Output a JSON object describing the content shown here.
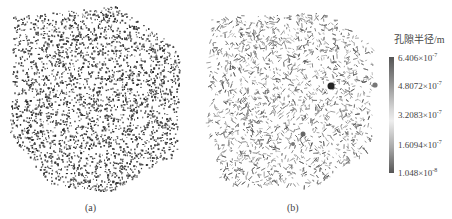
{
  "figure": {
    "panels": [
      {
        "id": "a",
        "caption": "(a)",
        "description": "3D point cloud of pore structure (dense, dark)"
      },
      {
        "id": "b",
        "caption": "(b)",
        "description": "3D pore network model colored by pore radius"
      }
    ],
    "colorbar": {
      "title": "孔隙半径/m",
      "ticks": [
        {
          "mantissa": "6.406",
          "exponent": "-7"
        },
        {
          "mantissa": "4.8072",
          "exponent": "-7"
        },
        {
          "mantissa": "3.2083",
          "exponent": "-7"
        },
        {
          "mantissa": "1.6094",
          "exponent": "-7"
        },
        {
          "mantissa": "1.048",
          "exponent": "-8"
        }
      ],
      "times": "×10",
      "colors": {
        "high": "#555555",
        "mid": "#eeeeee",
        "low": "#555555"
      }
    }
  }
}
